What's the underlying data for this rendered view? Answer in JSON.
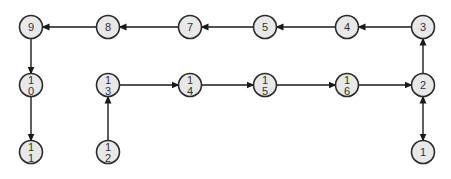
{
  "diagram": {
    "type": "directed-graph",
    "colors": {
      "background": "#ffffff",
      "node_fill": "#e8e8e8",
      "node_stroke": "#2a2a2a",
      "edge": "#1a1a1a",
      "label": "#333333"
    },
    "nodes": [
      {
        "id": "1",
        "line1": "1",
        "line2": "",
        "x": 423,
        "y": 152
      },
      {
        "id": "2",
        "line1": "2",
        "line2": "",
        "x": 423,
        "y": 85
      },
      {
        "id": "3",
        "line1": "3",
        "line2": "",
        "x": 423,
        "y": 27
      },
      {
        "id": "4",
        "line1": "4",
        "line2": "",
        "x": 347,
        "y": 27
      },
      {
        "id": "5",
        "line1": "5",
        "line2": "",
        "x": 265,
        "y": 27
      },
      {
        "id": "7",
        "line1": "7",
        "line2": "",
        "x": 190,
        "y": 27
      },
      {
        "id": "8",
        "line1": "8",
        "line2": "",
        "x": 108,
        "y": 27
      },
      {
        "id": "9",
        "line1": "9",
        "line2": "",
        "x": 31,
        "y": 27
      },
      {
        "id": "10",
        "line1": "1",
        "line2": "0",
        "x": 31,
        "y": 85
      },
      {
        "id": "11",
        "line1": "1",
        "line2": "1",
        "x": 31,
        "y": 152
      },
      {
        "id": "12",
        "line1": "1",
        "line2": "2",
        "x": 108,
        "y": 152
      },
      {
        "id": "13",
        "line1": "1",
        "line2": "3",
        "x": 108,
        "y": 85
      },
      {
        "id": "14",
        "line1": "1",
        "line2": "4",
        "x": 190,
        "y": 85
      },
      {
        "id": "15",
        "line1": "1",
        "line2": "5",
        "x": 265,
        "y": 85
      },
      {
        "id": "16",
        "line1": "1",
        "line2": "6",
        "x": 347,
        "y": 85
      }
    ],
    "edges": [
      {
        "from": "1",
        "to": "2",
        "bidirectional": true
      },
      {
        "from": "2",
        "to": "3",
        "bidirectional": false
      },
      {
        "from": "3",
        "to": "4",
        "bidirectional": false
      },
      {
        "from": "4",
        "to": "5",
        "bidirectional": false
      },
      {
        "from": "5",
        "to": "7",
        "bidirectional": false
      },
      {
        "from": "7",
        "to": "8",
        "bidirectional": false
      },
      {
        "from": "8",
        "to": "9",
        "bidirectional": false
      },
      {
        "from": "9",
        "to": "10",
        "bidirectional": false
      },
      {
        "from": "10",
        "to": "11",
        "bidirectional": false
      },
      {
        "from": "12",
        "to": "13",
        "bidirectional": false
      },
      {
        "from": "13",
        "to": "14",
        "bidirectional": false
      },
      {
        "from": "14",
        "to": "15",
        "bidirectional": false
      },
      {
        "from": "15",
        "to": "16",
        "bidirectional": false
      },
      {
        "from": "16",
        "to": "2",
        "bidirectional": false
      }
    ]
  }
}
